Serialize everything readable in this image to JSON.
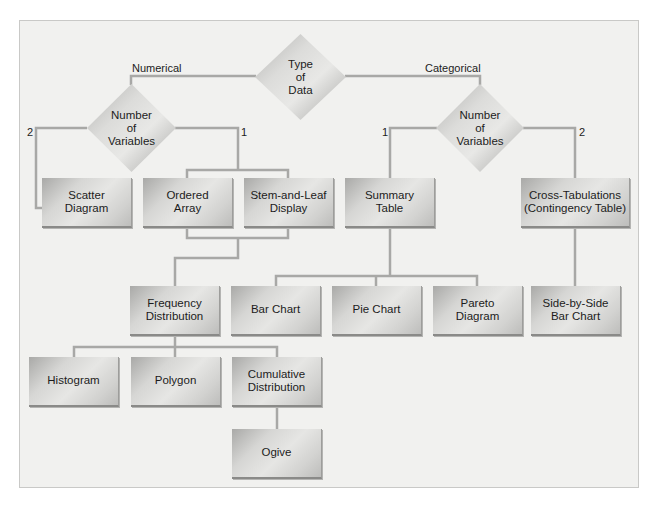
{
  "colors": {
    "frame_bg": "#f1f1ef",
    "line": "#a8a8a6",
    "node_light": "#e6e6e4",
    "node_dark": "#a9a9a7",
    "text": "#1c1c1c"
  },
  "diagram": {
    "title_node": "Type\nof\nData",
    "branches": {
      "numerical_label": "Numerical",
      "categorical_label": "Categorical"
    },
    "numerical": {
      "decision": "Number\nof\nVariables",
      "label_two": "2",
      "label_one": "1",
      "scatter": "Scatter\nDiagram",
      "ordered_array": "Ordered\nArray",
      "stem_leaf": "Stem-and-Leaf\nDisplay",
      "frequency": "Frequency\nDistribution",
      "histogram": "Histogram",
      "polygon": "Polygon",
      "cumulative": "Cumulative\nDistribution",
      "ogive": "Ogive"
    },
    "categorical": {
      "decision": "Number\nof\nVariables",
      "label_one": "1",
      "label_two": "2",
      "summary_table": "Summary\nTable",
      "cross_tab": "Cross-Tabulations\n(Contingency  Table)",
      "bar_chart": "Bar Chart",
      "pie_chart": "Pie Chart",
      "pareto": "Pareto\nDiagram",
      "side_by_side": "Side-by-Side\nBar Chart"
    }
  }
}
